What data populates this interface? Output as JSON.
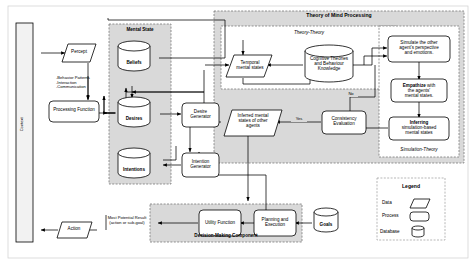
{
  "diagram": {
    "regions": {
      "tom": "Theory of Mind Processing",
      "theory_theory": "Theory-Theory",
      "simulation_theory": "Simulation-Theory",
      "mental_state": "Mental State",
      "decision": "Decision-Making Component"
    },
    "nodes": {
      "context": "Context",
      "percept": "Percept",
      "processing_function": "Processing Function",
      "beliefs": "Beliefs",
      "desires": "Desires",
      "intentions": "Intentions",
      "desire_generator": "Desire\nGenerator",
      "intention_generator": "Intention\nGenerator",
      "temporal": "Temporal\nmental states",
      "cognitive": "Cognitive Theories\nand Behaviour\nKnowledge",
      "simulate": "Simulate the other\nagent's perspective\nand emotions.",
      "empathize_bold": "Empathize",
      "empathize_rest": " with\nthe agents'\nmental states.",
      "inferring_bold": "Inferring",
      "inferring_rest": "simulation-based\nmental states",
      "consistency": "Consistency\nEvaluation",
      "inferred": "Inferred mental\nstates of other\nagents",
      "utility": "Utility Function",
      "planning": "Planning and\nExecution",
      "goals": "Goals",
      "action": "Action"
    },
    "edge_labels": {
      "behavior": "-Behavior Patterns\n-Interaction\n-Communication",
      "yes": "Yes",
      "no": "No",
      "most_potential": "Most Potential Result\n(action or sub-goal)"
    },
    "legend": {
      "title": "Legend",
      "items": [
        {
          "label": "Data",
          "shape": "parallelogram"
        },
        {
          "label": "Process",
          "shape": "rounded-rect"
        },
        {
          "label": "Database",
          "shape": "cylinder"
        }
      ]
    },
    "colors": {
      "stroke": "#000000",
      "region_fill": "#d9d9d9",
      "node_fill": "#ffffff",
      "context_fill": "#f2f2f2",
      "page_bg": "#ffffff"
    }
  }
}
